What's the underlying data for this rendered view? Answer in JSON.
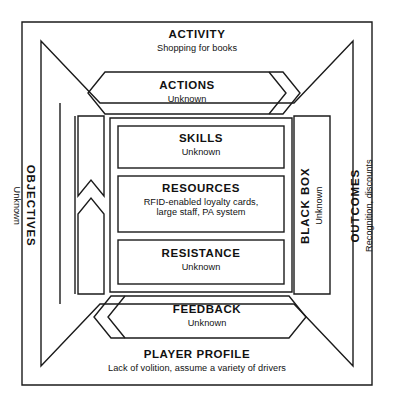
{
  "diagram": {
    "bands": {
      "activity": {
        "name": "activity-band",
        "title": "ACTIVITY",
        "subtitle": "Shopping for books"
      },
      "player_profile": {
        "name": "player-profile-band",
        "title": "PLAYER PROFILE",
        "subtitle": "Lack of volition, assume a variety of drivers"
      },
      "objectives": {
        "name": "objectives-band",
        "title": "OBJECTIVES",
        "subtitle": "Unknown"
      },
      "outcomes": {
        "name": "outcomes-band",
        "title": "OUTCOMES",
        "subtitle": "Recognition, discounts"
      },
      "actions": {
        "name": "actions-band",
        "title": "ACTIONS",
        "subtitle": "Unknown"
      },
      "feedback": {
        "name": "feedback-band",
        "title": "FEEDBACK",
        "subtitle": "Unknown"
      },
      "black_box": {
        "name": "black-box-band",
        "title": "BLACK BOX",
        "subtitle": "Unknown"
      }
    },
    "inner_boxes": [
      {
        "name": "skills-box",
        "title": "SKILLS",
        "subtitle_lines": [
          "Unknown"
        ]
      },
      {
        "name": "resources-box",
        "title": "RESOURCES",
        "subtitle_lines": [
          "RFID-enabled loyalty cards,",
          "large staff, PA system"
        ]
      },
      {
        "name": "resistance-box",
        "title": "RESISTANCE",
        "subtitle_lines": [
          "Unknown"
        ]
      }
    ],
    "colors": {
      "stroke": "#1b1b1b",
      "text": "#111111",
      "background": "#ffffff"
    }
  }
}
